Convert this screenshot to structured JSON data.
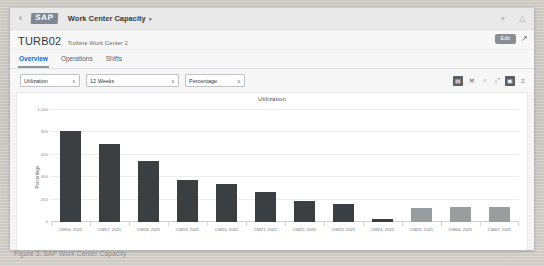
{
  "backdrop": {
    "ghost_text": "Tablet-UI-Utilization-Chart",
    "caption": "Figure 3. SAP Work Center Capacity"
  },
  "shellbar": {
    "back_label": "‹",
    "logo": "SAP",
    "app_title": "Work Center Capacity",
    "caret": "▾",
    "icons": [
      {
        "name": "search-icon",
        "glyph": "⌕"
      },
      {
        "name": "user-icon",
        "glyph": "△"
      }
    ]
  },
  "header": {
    "object_id": "TURB02",
    "object_subtitle": "Turbine Work Center 2",
    "edit_label": "Edit",
    "share_glyph": "↗"
  },
  "tabs": [
    {
      "label": "Overview",
      "active": true
    },
    {
      "label": "Operations",
      "active": false
    },
    {
      "label": "Shifts",
      "active": false
    }
  ],
  "filters": [
    {
      "name": "measure-select",
      "value": "Utilization",
      "caret": "∨"
    },
    {
      "name": "period-select",
      "value": "12 Weeks",
      "caret": "∨"
    },
    {
      "name": "unit-select",
      "value": "Percentage",
      "caret": "∨"
    }
  ],
  "toolbar_icons": [
    {
      "name": "chart-type-bar-icon",
      "glyph": "▤",
      "selected": true
    },
    {
      "name": "settings-wrench-icon",
      "glyph": "⚒",
      "selected": false
    },
    {
      "name": "zoom-out-icon",
      "glyph": "⌕",
      "selected": false
    },
    {
      "name": "fullscreen-icon",
      "glyph": "⤢",
      "selected": false
    },
    {
      "name": "legend-toggle-icon",
      "glyph": "▣",
      "selected": true
    },
    {
      "name": "list-view-icon",
      "glyph": "≡",
      "selected": false
    }
  ],
  "chart_data": {
    "type": "bar",
    "title": "Utilization",
    "xlabel": "",
    "ylabel": "Percentage",
    "ylim": [
      0,
      1000
    ],
    "yticks": [
      0,
      200,
      400,
      600,
      800,
      1000
    ],
    "ytick_labels": [
      "0",
      "200",
      "400",
      "600",
      "800",
      "1,000"
    ],
    "grid": true,
    "legend": "none",
    "bar_colors": {
      "dark": "#3c3f41",
      "light": "#9a9da0"
    },
    "categories": [
      "CW16, 2021",
      "CW17, 2021",
      "CW18, 2021",
      "CW19, 2021",
      "CW20, 2021",
      "CW21, 2021",
      "CW22, 2021",
      "CW23, 2021",
      "CW24, 2021",
      "CW25, 2021",
      "CW06, 2021",
      "CW07, 2021"
    ],
    "values": [
      815,
      700,
      545,
      375,
      340,
      270,
      185,
      160,
      25,
      125,
      135,
      135
    ],
    "colors": [
      "#3c3f41",
      "#3c3f41",
      "#3c3f41",
      "#3c3f41",
      "#3c3f41",
      "#3c3f41",
      "#3c3f41",
      "#3c3f41",
      "#3c3f41",
      "#9a9da0",
      "#9a9da0",
      "#9a9da0"
    ]
  }
}
